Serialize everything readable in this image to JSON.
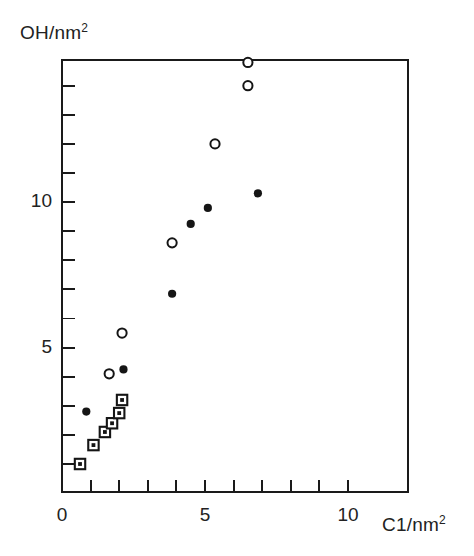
{
  "chart_data": {
    "type": "scatter",
    "title": "",
    "xlabel": "C1/nm2",
    "ylabel": "OH/nm2",
    "xlabel_base": "C1/nm",
    "xlabel_exp": "2",
    "ylabel_base": "OH/nm",
    "ylabel_exp": "2",
    "xlim": [
      0,
      11
    ],
    "ylim": [
      0,
      15.7
    ],
    "xticks": [
      0,
      1,
      2,
      3,
      4,
      5,
      6,
      7,
      8,
      9,
      10
    ],
    "xtick_labels": [
      "0",
      "",
      "",
      "",
      "",
      "5",
      "",
      "",
      "",
      "",
      "10"
    ],
    "yticks": [
      1,
      2,
      3,
      4,
      5,
      6,
      7,
      8,
      9,
      10,
      11,
      12,
      13,
      14
    ],
    "ytick_labels": [
      "",
      "",
      "",
      "",
      "5",
      "",
      "",
      "",
      "",
      "10",
      "",
      "",
      "",
      ""
    ],
    "grid": false,
    "legend": "none",
    "series": [
      {
        "name": "open-circle",
        "marker": "open circle",
        "points": [
          {
            "x": 1.65,
            "y": 4.1
          },
          {
            "x": 2.1,
            "y": 5.5
          },
          {
            "x": 3.85,
            "y": 8.6
          },
          {
            "x": 5.35,
            "y": 12.0
          },
          {
            "x": 6.5,
            "y": 14.0
          },
          {
            "x": 6.5,
            "y": 14.8
          }
        ]
      },
      {
        "name": "filled-circle",
        "marker": "filled circle",
        "points": [
          {
            "x": 0.85,
            "y": 2.8
          },
          {
            "x": 2.15,
            "y": 4.25
          },
          {
            "x": 3.85,
            "y": 6.85
          },
          {
            "x": 4.5,
            "y": 9.25
          },
          {
            "x": 5.1,
            "y": 9.8
          },
          {
            "x": 6.85,
            "y": 10.3
          }
        ]
      },
      {
        "name": "dotted-square",
        "marker": "open square with center dot",
        "points": [
          {
            "x": 0.63,
            "y": 1.0
          },
          {
            "x": 1.1,
            "y": 1.65
          },
          {
            "x": 1.5,
            "y": 2.1
          },
          {
            "x": 1.75,
            "y": 2.4
          },
          {
            "x": 2.0,
            "y": 2.75
          },
          {
            "x": 2.1,
            "y": 3.2
          }
        ]
      }
    ]
  },
  "axes": {
    "colors": {
      "line": "#1a1a1a",
      "marker": "#151515",
      "background": "#ffffff"
    },
    "pixel_frame": {
      "left": 62,
      "right": 408,
      "top": 60,
      "bottom": 492
    },
    "scale": {
      "x0_px": 62,
      "x_per_unit": 28.6,
      "y1_px": 464,
      "y_per_unit": 29.1
    }
  }
}
